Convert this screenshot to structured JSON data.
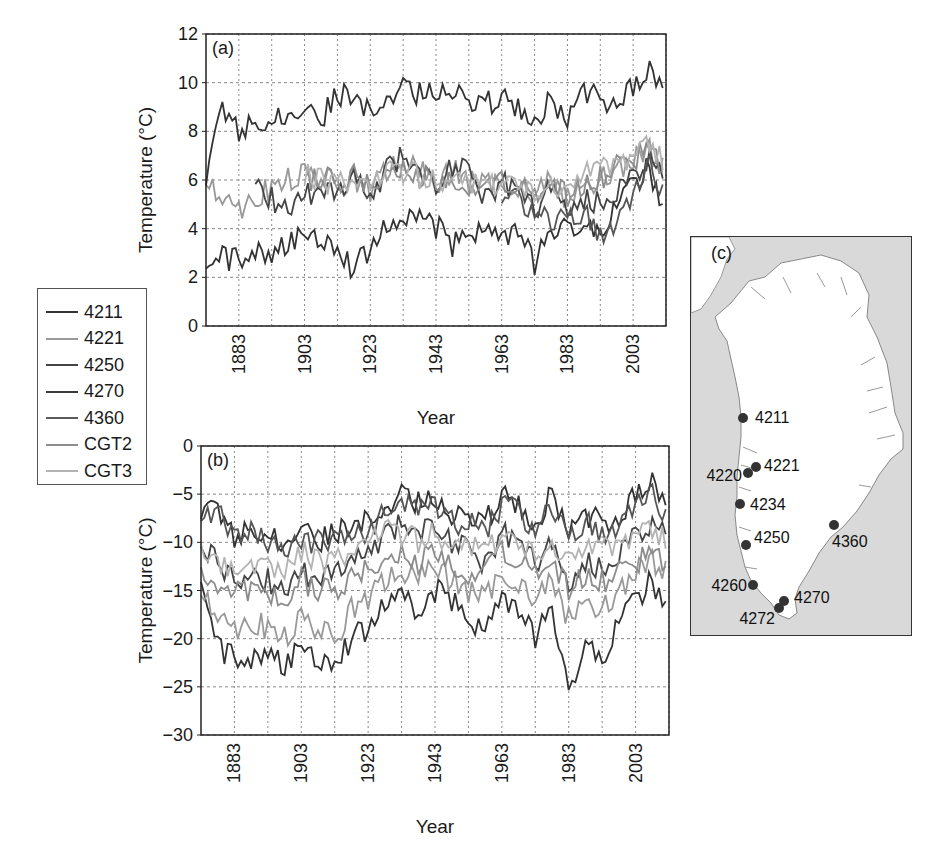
{
  "chart_data": [
    {
      "panel": "(a)",
      "type": "line",
      "title": "",
      "xlabel": "Year",
      "ylabel": "Temperature (°C)",
      "xlim": [
        1873,
        2013
      ],
      "ylim": [
        0,
        12
      ],
      "yticks": [
        0,
        2,
        4,
        6,
        8,
        10,
        12
      ],
      "xticks": [
        1883,
        1903,
        1923,
        1943,
        1963,
        1983,
        2003
      ],
      "grid": true,
      "legend_position": "left-outside",
      "series": [
        {
          "name": "4211",
          "color": "#333333",
          "x": [
            1873,
            1878,
            1883,
            1888,
            1893,
            1898,
            1903,
            1908,
            1913,
            1918,
            1923,
            1928,
            1933,
            1938,
            1943,
            1948,
            1953,
            1958,
            1963,
            1968,
            1973,
            1978,
            1983,
            1988,
            1993,
            1998,
            2003,
            2008,
            2013
          ],
          "values": [
            2.0,
            2.8,
            2.7,
            3.2,
            3.0,
            3.4,
            3.6,
            3.7,
            3.4,
            2.3,
            3.2,
            4.3,
            4.2,
            4.6,
            4.1,
            3.3,
            3.9,
            4.0,
            3.5,
            4.0,
            2.5,
            3.8,
            4.4,
            3.8,
            4.0,
            5.0,
            5.8,
            6.5,
            4.5
          ]
        },
        {
          "name": "4221",
          "color": "#999999",
          "x": [
            1873,
            1878,
            1883,
            1888,
            1893,
            1898,
            1903,
            1908,
            1913,
            1918,
            1923,
            1928,
            1933,
            1938,
            1943,
            1948,
            1953,
            1958,
            1963,
            1968,
            1973,
            1978,
            1983,
            1988,
            1993,
            1998,
            2003,
            2008,
            2013
          ],
          "values": [
            6.0,
            5.5,
            4.8,
            5.4,
            5.6,
            6.0,
            6.2,
            6.1,
            5.8,
            6.0,
            5.5,
            6.4,
            6.8,
            6.3,
            5.9,
            6.4,
            6.0,
            5.7,
            6.0,
            5.8,
            5.4,
            6.0,
            5.2,
            5.8,
            6.0,
            6.5,
            6.8,
            7.2,
            6.4
          ]
        },
        {
          "name": "4250",
          "color": "#444444",
          "x": [
            1873,
            1878,
            1883,
            1888,
            1893,
            1898,
            1903,
            1908,
            1913,
            1918,
            1923,
            1928,
            1933,
            1938,
            1943,
            1948,
            1953,
            1958,
            1963,
            1968,
            1973,
            1978,
            1983,
            1988,
            1993,
            1998,
            2003,
            2008,
            2013
          ],
          "values": [
            null,
            null,
            null,
            6.0,
            5.2,
            4.8,
            5.4,
            5.6,
            5.4,
            6.2,
            5.2,
            6.6,
            7.0,
            6.4,
            5.8,
            6.6,
            6.2,
            5.4,
            5.9,
            5.6,
            4.8,
            5.8,
            4.6,
            5.2,
            5.0,
            5.6,
            6.2,
            7.0,
            6.0
          ]
        },
        {
          "name": "4270",
          "color": "#333333",
          "x": [
            1873,
            1878,
            1883,
            1888,
            1893,
            1898,
            1903,
            1908,
            1913,
            1918,
            1923,
            1928,
            1933,
            1938,
            1943,
            1948,
            1953,
            1958,
            1963,
            1968,
            1973,
            1978,
            1983,
            1988,
            1993,
            1998,
            2003,
            2008,
            2013
          ],
          "values": [
            6.0,
            9.2,
            7.8,
            8.6,
            8.5,
            8.8,
            8.6,
            8.5,
            9.5,
            9.6,
            8.6,
            9.6,
            9.8,
            9.5,
            9.8,
            9.8,
            9.3,
            9.1,
            9.4,
            9.0,
            8.6,
            9.2,
            8.4,
            9.8,
            9.2,
            9.5,
            9.8,
            10.4,
            9.5
          ]
        },
        {
          "name": "4360",
          "color": "#555555",
          "x": [
            1963,
            1968,
            1973,
            1978,
            1983,
            1988,
            1993,
            1998,
            2003,
            2008,
            2013
          ],
          "values": [
            4.8,
            5.2,
            4.6,
            4.4,
            4.3,
            4.6,
            3.8,
            4.4,
            5.4,
            6.6,
            5.2
          ]
        },
        {
          "name": "CGT2",
          "color": "#8c8c8c",
          "x": [
            1903,
            1908,
            1913,
            1918,
            1923,
            1928,
            1933,
            1938,
            1943,
            1948,
            1953,
            1958,
            1963,
            1968,
            1973,
            1978,
            1983,
            1988,
            1993,
            1998,
            2003,
            2008,
            2013
          ],
          "values": [
            6.0,
            6.1,
            5.9,
            6.1,
            5.6,
            6.3,
            6.5,
            6.2,
            5.8,
            6.2,
            5.9,
            5.6,
            5.9,
            5.8,
            5.4,
            5.9,
            5.3,
            6.0,
            6.1,
            6.6,
            6.9,
            7.3,
            6.5
          ]
        },
        {
          "name": "CGT3",
          "color": "#b3b3b3",
          "x": [
            1903,
            1908,
            1913,
            1918,
            1923,
            1928,
            1933,
            1938,
            1943,
            1948,
            1953,
            1958,
            1963,
            1968,
            1973,
            1978,
            1983,
            1988,
            1993,
            1998,
            2003,
            2008,
            2013
          ],
          "values": [
            6.2,
            6.0,
            5.8,
            6.0,
            5.7,
            6.2,
            6.4,
            6.1,
            5.9,
            6.3,
            6.0,
            5.7,
            6.0,
            5.9,
            5.5,
            6.0,
            5.4,
            6.2,
            6.3,
            6.8,
            7.0,
            7.4,
            6.6
          ]
        }
      ]
    },
    {
      "panel": "(b)",
      "type": "line",
      "title": "",
      "xlabel": "Year",
      "ylabel": "Temperature (°C)",
      "xlim": [
        1873,
        2013
      ],
      "ylim": [
        -30,
        0
      ],
      "yticks": [
        0,
        -5,
        -10,
        -15,
        -20,
        -25,
        -30
      ],
      "xticks": [
        1883,
        1903,
        1923,
        1943,
        1963,
        1983,
        2003
      ],
      "grid": true,
      "series": [
        {
          "name": "4211",
          "color": "#333333",
          "x": [
            1873,
            1878,
            1883,
            1888,
            1893,
            1898,
            1903,
            1908,
            1913,
            1918,
            1923,
            1928,
            1933,
            1938,
            1943,
            1948,
            1953,
            1958,
            1963,
            1968,
            1973,
            1978,
            1983,
            1988,
            1993,
            1998,
            2003,
            2008,
            2013
          ],
          "values": [
            -15,
            -21,
            -22,
            -22,
            -21,
            -23,
            -21,
            -22,
            -22,
            -20,
            -19,
            -16,
            -15,
            -18,
            -15,
            -16,
            -18,
            -19,
            -16,
            -17,
            -20,
            -17,
            -25,
            -21,
            -22,
            -18,
            -16,
            -14,
            -17
          ]
        },
        {
          "name": "4221",
          "color": "#999999",
          "x": [
            1873,
            1878,
            1883,
            1888,
            1893,
            1898,
            1903,
            1908,
            1913,
            1918,
            1923,
            1928,
            1933,
            1938,
            1943,
            1948,
            1953,
            1958,
            1963,
            1968,
            1973,
            1978,
            1983,
            1988,
            1993,
            1998,
            2003,
            2008,
            2013
          ],
          "values": [
            -15,
            -17,
            -19,
            -18,
            -19,
            -20,
            -18,
            -19,
            -20,
            -17,
            -16,
            -14,
            -13,
            -14,
            -12,
            -14,
            -15,
            -16,
            -13,
            -14,
            -16,
            -14,
            -18,
            -16,
            -17,
            -15,
            -13,
            -12,
            -13
          ]
        },
        {
          "name": "4250",
          "color": "#444444",
          "x": [
            1873,
            1878,
            1883,
            1888,
            1893,
            1898,
            1903,
            1908,
            1913,
            1918,
            1923,
            1928,
            1933,
            1938,
            1943,
            1948,
            1953,
            1958,
            1963,
            1968,
            1973,
            1978,
            1983,
            1988,
            1993,
            1998,
            2003,
            2008,
            2013
          ],
          "values": [
            -10,
            -12,
            -14,
            -13,
            -14,
            -15,
            -13,
            -14,
            -13,
            -12,
            -11,
            -9,
            -8,
            -9,
            -8,
            -10,
            -11,
            -12,
            -9,
            -10,
            -12,
            -10,
            -15,
            -12,
            -13,
            -11,
            -9,
            -8,
            -9
          ]
        },
        {
          "name": "4270",
          "color": "#333333",
          "x": [
            1873,
            1878,
            1883,
            1888,
            1893,
            1898,
            1903,
            1908,
            1913,
            1918,
            1923,
            1928,
            1933,
            1938,
            1943,
            1948,
            1953,
            1958,
            1963,
            1968,
            1973,
            1978,
            1983,
            1988,
            1993,
            1998,
            2003,
            2008,
            2013
          ],
          "values": [
            -7,
            -6,
            -10,
            -8,
            -9,
            -10,
            -9,
            -10,
            -9,
            -8,
            -8,
            -6,
            -5,
            -6,
            -5,
            -7,
            -7,
            -8,
            -5,
            -6,
            -8,
            -5,
            -9,
            -7,
            -8,
            -7,
            -5,
            -4,
            -7
          ]
        },
        {
          "name": "4360",
          "color": "#555555",
          "x": [
            1873,
            1878,
            1883,
            1888,
            1893,
            1898,
            1903,
            1908,
            1913,
            1918,
            1923,
            1928,
            1933,
            1938,
            1943,
            1948,
            1953,
            1958,
            1963,
            1968,
            1973,
            1978,
            1983,
            1988,
            1993,
            1998,
            2003,
            2008,
            2013
          ],
          "values": [
            -8,
            -7,
            -10,
            -9,
            -10,
            -11,
            -10,
            -10,
            -10,
            -9,
            -9,
            -7,
            -6,
            -7,
            -6,
            -8,
            -8,
            -9,
            -6,
            -7,
            -9,
            -6,
            -10,
            -8,
            -9,
            -8,
            -6,
            -5,
            -8
          ]
        },
        {
          "name": "CGT2",
          "color": "#8c8c8c",
          "x": [
            1873,
            1878,
            1883,
            1888,
            1893,
            1898,
            1903,
            1908,
            1913,
            1918,
            1923,
            1928,
            1933,
            1938,
            1943,
            1948,
            1953,
            1958,
            1963,
            1968,
            1973,
            1978,
            1983,
            1988,
            1993,
            1998,
            2003,
            2008,
            2013
          ],
          "values": [
            -13,
            -14,
            -15,
            -15,
            -15,
            -16,
            -14,
            -15,
            -15,
            -14,
            -13,
            -12,
            -11,
            -12,
            -11,
            -12,
            -13,
            -13,
            -11,
            -12,
            -13,
            -12,
            -15,
            -13,
            -14,
            -13,
            -12,
            -11,
            -12
          ]
        },
        {
          "name": "CGT3",
          "color": "#b3b3b3",
          "x": [
            1873,
            1878,
            1883,
            1888,
            1893,
            1898,
            1903,
            1908,
            1913,
            1918,
            1923,
            1928,
            1933,
            1938,
            1943,
            1948,
            1953,
            1958,
            1963,
            1968,
            1973,
            1978,
            1983,
            1988,
            1993,
            1998,
            2003,
            2008,
            2013
          ],
          "values": [
            -11,
            -12,
            -13,
            -12,
            -12,
            -13,
            -11,
            -12,
            -12,
            -11,
            -10,
            -9,
            -9,
            -10,
            -9,
            -10,
            -10,
            -11,
            -9,
            -10,
            -11,
            -10,
            -12,
            -11,
            -11,
            -10,
            -9,
            -9,
            -10
          ]
        }
      ]
    },
    {
      "panel": "(c)",
      "type": "map",
      "title": "Greenland station locations",
      "stations": [
        {
          "id": "4211",
          "x": 52,
          "y": 181
        },
        {
          "id": "4220",
          "x": 57,
          "y": 236
        },
        {
          "id": "4221",
          "x": 65,
          "y": 230
        },
        {
          "id": "4234",
          "x": 49,
          "y": 267
        },
        {
          "id": "4250",
          "x": 55,
          "y": 308
        },
        {
          "id": "4260",
          "x": 62,
          "y": 348
        },
        {
          "id": "4270",
          "x": 93,
          "y": 364
        },
        {
          "id": "4272",
          "x": 88,
          "y": 371
        },
        {
          "id": "4360",
          "x": 143,
          "y": 288
        }
      ]
    }
  ],
  "panels": {
    "a": {
      "label": "(a)",
      "xlabel": "Year",
      "ylabel": "Temperature (°C)",
      "yticks": [
        "0",
        "2",
        "4",
        "6",
        "8",
        "10",
        "12"
      ],
      "xticks": [
        "1883",
        "1903",
        "1923",
        "1943",
        "1963",
        "1983",
        "2003"
      ]
    },
    "b": {
      "label": "(b)",
      "xlabel": "Year",
      "ylabel": "Temperature (°C)",
      "yticks": [
        "0",
        "-5",
        "-10",
        "-15",
        "-20",
        "-25",
        "-30"
      ],
      "xticks": [
        "1883",
        "1903",
        "1923",
        "1943",
        "1963",
        "1983",
        "2003"
      ]
    },
    "c": {
      "label": "(c)"
    }
  },
  "legend": {
    "items": [
      {
        "label": "4211",
        "color": "#333333"
      },
      {
        "label": "4221",
        "color": "#9a9a9a"
      },
      {
        "label": "4250",
        "color": "#444444"
      },
      {
        "label": "4270",
        "color": "#3a3a3a"
      },
      {
        "label": "4360",
        "color": "#5a5a5a"
      },
      {
        "label": "CGT2",
        "color": "#8c8c8c"
      },
      {
        "label": "CGT3",
        "color": "#b3b3b3"
      }
    ]
  }
}
